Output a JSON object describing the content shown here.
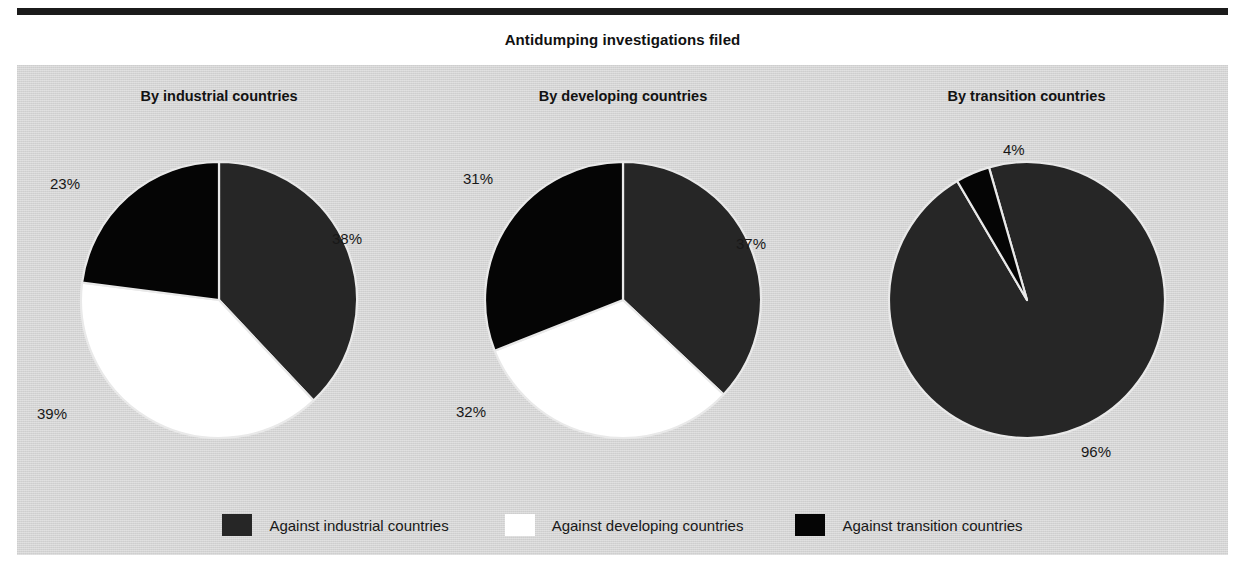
{
  "figure": {
    "title": "Antidumping investigations filed",
    "panel_color": "#d4d4d4",
    "page_color": "#ffffff",
    "rule_color": "#1b1b1b"
  },
  "series_colors": {
    "against_industrial": "#262626",
    "against_developing": "#ffffff",
    "against_transition": "#050505"
  },
  "legend": {
    "items": [
      {
        "label": "Against industrial countries",
        "color": "#262626",
        "swatch": "swatch-industrial"
      },
      {
        "label": "Against developing countries",
        "color": "#ffffff",
        "swatch": "swatch-developing"
      },
      {
        "label": "Against transition countries",
        "color": "#050505",
        "swatch": "swatch-transition"
      }
    ]
  },
  "chart_data": {
    "type": "pie",
    "title": "Antidumping investigations filed",
    "xlabel": "",
    "ylabel": "",
    "units": "percent",
    "legend_position": "bottom",
    "grid": false,
    "categories": [
      "Against industrial countries",
      "Against developing countries",
      "Against transition countries"
    ],
    "panels": [
      {
        "title": "By industrial countries",
        "start_angle_deg": 0,
        "values": [
          38,
          39,
          23
        ],
        "labels": [
          "38%",
          "39%",
          "23%"
        ],
        "slices": [
          {
            "name": "Against industrial countries",
            "value": 38,
            "label": "38%",
            "color": "#262626"
          },
          {
            "name": "Against developing countries",
            "value": 39,
            "label": "39%",
            "color": "#ffffff"
          },
          {
            "name": "Against transition countries",
            "value": 23,
            "label": "23%",
            "color": "#050505"
          }
        ]
      },
      {
        "title": "By developing countries",
        "start_angle_deg": 0,
        "values": [
          37,
          32,
          31
        ],
        "labels": [
          "37%",
          "32%",
          "31%"
        ],
        "slices": [
          {
            "name": "Against industrial countries",
            "value": 37,
            "label": "37%",
            "color": "#262626"
          },
          {
            "name": "Against developing countries",
            "value": 32,
            "label": "32%",
            "color": "#ffffff"
          },
          {
            "name": "Against transition countries",
            "value": 31,
            "label": "31%",
            "color": "#050505"
          }
        ]
      },
      {
        "title": "By transition countries",
        "start_angle_deg": -16,
        "values": [
          96,
          0,
          4
        ],
        "labels": [
          "96%",
          "",
          "4%"
        ],
        "slices": [
          {
            "name": "Against industrial countries",
            "value": 96,
            "label": "96%",
            "color": "#262626"
          },
          {
            "name": "Against transition countries",
            "value": 4,
            "label": "4%",
            "color": "#050505"
          }
        ]
      }
    ]
  },
  "label_positions": [
    [
      {
        "text": "38%",
        "left": 315,
        "top": 165
      },
      {
        "text": "39%",
        "left": 20,
        "top": 340
      },
      {
        "text": "23%",
        "left": 33,
        "top": 110
      }
    ],
    [
      {
        "text": "37%",
        "left": 315,
        "top": 170
      },
      {
        "text": "32%",
        "left": 35,
        "top": 338
      },
      {
        "text": "31%",
        "left": 42,
        "top": 105
      }
    ],
    [
      {
        "text": "96%",
        "left": 256,
        "top": 378
      },
      {
        "text": "4%",
        "left": 178,
        "top": 76
      }
    ]
  ]
}
